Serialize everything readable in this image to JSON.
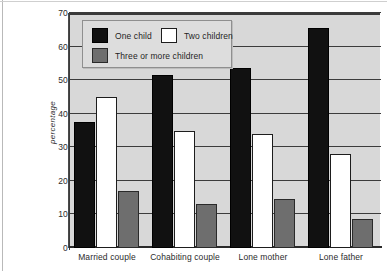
{
  "chart_data": {
    "type": "bar",
    "title": "",
    "subtitle": "",
    "xlabel": "",
    "ylabel": "percentage",
    "ylim": [
      0,
      70
    ],
    "ytick_values": [
      0,
      10,
      20,
      30,
      40,
      50,
      60,
      70
    ],
    "ytick_labels": [
      "0",
      "10",
      "20",
      "30",
      "40",
      "50",
      "60",
      "70"
    ],
    "grid": "horizontal",
    "legend_position": "top-left inside plot",
    "categories": [
      "Married couple",
      "Cohabiting couple",
      "Lone mother",
      "Lone father"
    ],
    "series": [
      {
        "name": "One child",
        "color": "#111111",
        "values": [
          37.5,
          51.5,
          53.5,
          65.5
        ]
      },
      {
        "name": "Two children",
        "color": "#ffffff",
        "values": [
          45.0,
          35.0,
          34.0,
          28.0
        ]
      },
      {
        "name": "Three or more children",
        "color": "#6e6e6e",
        "values": [
          17.0,
          13.0,
          14.5,
          8.5
        ]
      }
    ]
  },
  "legend": {
    "items": [
      {
        "label": "One child",
        "swatch": "black-swatch"
      },
      {
        "label": "Two children",
        "swatch": "white-swatch"
      },
      {
        "label": "Three or more children",
        "swatch": "grey-swatch"
      }
    ]
  },
  "axes": {
    "y_title": "percentage",
    "y_ticks": [
      "70",
      "60",
      "50",
      "40",
      "30",
      "20",
      "10",
      "0"
    ],
    "x_ticks": [
      "Married couple",
      "Cohabiting couple",
      "Lone mother",
      "Lone father"
    ]
  },
  "colors": {
    "plot_background": "#d8d8d8",
    "gridline": "#3c3c3c",
    "axis": "#2a2a2a",
    "series_one_child": "#111111",
    "series_two_children": "#ffffff",
    "series_three_or_more": "#6e6e6e",
    "legend_background": "#dddddd",
    "text": "#2b2b2b"
  }
}
